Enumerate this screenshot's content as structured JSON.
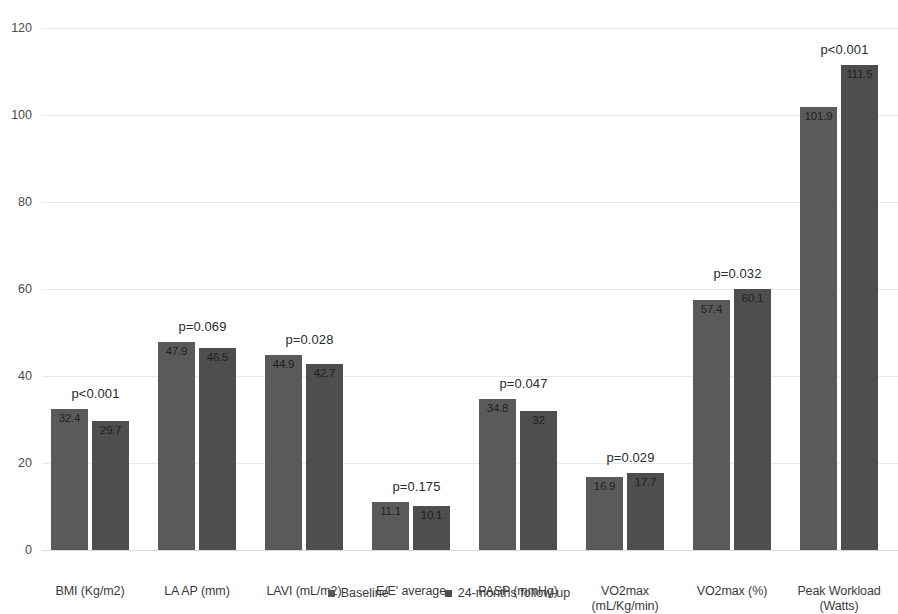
{
  "chart_data": {
    "type": "bar",
    "title": "",
    "subtitle": "",
    "xlabel": "",
    "ylabel": "",
    "ylim": [
      0,
      120
    ],
    "yticks": [
      0,
      20,
      40,
      60,
      80,
      100,
      120
    ],
    "grid": true,
    "legend_position": "bottom",
    "categories": [
      "BMI (Kg/m2)",
      "LA AP (mm)",
      "LAVI (mL/m2)",
      "E/E' average",
      "PASP (mmHg)",
      "VO2max\n(mL/Kg/min)",
      "VO2max (%)",
      "Peak Workload\n(Watts)"
    ],
    "series": [
      {
        "name": "Baseline",
        "color": "#5a5a5a",
        "values": [
          32.4,
          47.9,
          44.9,
          11.1,
          34.8,
          16.9,
          57.4,
          101.9
        ],
        "labels": [
          "32.4",
          "47.9",
          "44.9",
          "11.1",
          "34.8",
          "16.9",
          "57.4",
          "101.9"
        ]
      },
      {
        "name": "24-months follow-up",
        "color": "#4e4e4e",
        "values": [
          29.7,
          46.5,
          42.7,
          10.1,
          32.0,
          17.7,
          60.1,
          111.5
        ],
        "labels": [
          "29.7",
          "46.5",
          "42.7",
          "10.1",
          "32",
          "17.7",
          "60.1",
          "111.5"
        ]
      }
    ],
    "annotations": [
      "p<0.001",
      "p=0.069",
      "p=0.028",
      "p=0.175",
      "p=0.047",
      "p=0.029",
      "p=0.032",
      "p<0.001"
    ]
  },
  "axis": {
    "tick_labels": [
      "120",
      "100",
      "80",
      "60",
      "40",
      "20",
      "0"
    ]
  },
  "legend": {
    "items": [
      {
        "label": "Baseline"
      },
      {
        "label": "24-months follow-up"
      }
    ]
  }
}
